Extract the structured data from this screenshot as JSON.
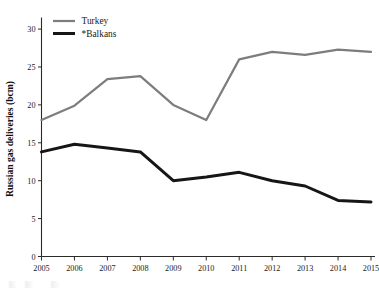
{
  "chart_data": {
    "type": "line",
    "title": "",
    "subtitle": "",
    "xlabel": "",
    "ylabel": "Russian gas deliveries  (bcm)",
    "categories": [
      "2005",
      "2006",
      "2007",
      "2008",
      "2009",
      "2010",
      "2011",
      "2012",
      "2013",
      "2014",
      "2015"
    ],
    "x": [
      2005,
      2006,
      2007,
      2008,
      2009,
      2010,
      2011,
      2012,
      2013,
      2014,
      2015
    ],
    "series": [
      {
        "name": "Turkey",
        "color": "#7d7d7d",
        "values": [
          18.0,
          19.9,
          23.4,
          23.8,
          20.0,
          18.0,
          26.0,
          27.0,
          26.6,
          27.3,
          27.0
        ]
      },
      {
        "name": "*Balkans",
        "color": "#161616",
        "values": [
          13.8,
          14.8,
          14.3,
          13.8,
          10.0,
          10.5,
          11.1,
          10.0,
          9.3,
          7.4,
          7.2
        ]
      }
    ],
    "ylim": [
      0,
      31
    ],
    "xlim": [
      2005,
      2015
    ],
    "yticks": [
      0,
      5,
      10,
      15,
      20,
      25,
      30
    ],
    "ytick_labels": [
      "0",
      "5",
      "10",
      "15",
      "20",
      "25",
      "30"
    ],
    "xtick_labels": [
      "2005",
      "2006",
      "2007",
      "2008",
      "2009",
      "2010",
      "2011",
      "2012",
      "2013",
      "2014",
      "2015"
    ],
    "grid": false,
    "legend_position": "top-left",
    "legend": [
      {
        "label": "Turkey",
        "color": "#7d7d7d",
        "line_width": 2.2
      },
      {
        "label": "*Balkans",
        "color": "#161616",
        "line_width": 3.0
      }
    ]
  },
  "axes": {
    "y_axis_title": "Russian gas deliveries  (bcm)"
  }
}
